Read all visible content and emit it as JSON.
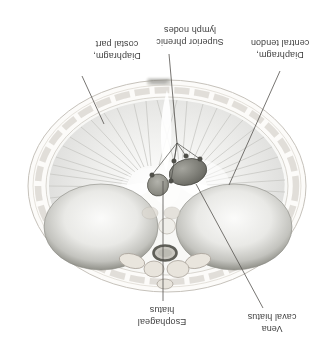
{
  "labels": {
    "diaphragm_costal_part": "Diaphragm,\ncostal part",
    "superior_phrenic_lymph_nodes": "Superior phrenic\nlymph nodes",
    "diaphragm_central_tendon": "Diaphragm,\ncentral tendon",
    "esophageal_hiatus": "Esophageal\nhiatus",
    "vena_caval_hiatus": "Vena\ncaval hiatus"
  },
  "palette": {
    "background": "#ffffff",
    "label_text": "#3f3f3f",
    "leader_line": "#54524e",
    "body_wall": "#e9e6e0",
    "rim_stroke": "#c7c3bc",
    "muscle_fiber": "#c8c8c4",
    "dome_edge": "#7b7b74",
    "vessel_dark": "#6e6e67",
    "lymph_node": "#50504a"
  }
}
